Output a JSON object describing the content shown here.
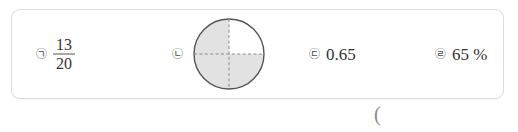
{
  "page": {
    "answer_paren": "("
  },
  "choice_box": {
    "options": [
      {
        "marker": "㉠",
        "type": "fraction",
        "numerator": "13",
        "denominator": "20",
        "text": "13/20"
      },
      {
        "marker": "㉡",
        "type": "pie-diagram",
        "text": "",
        "diagram": {
          "name": "circle-quarters",
          "total_parts": 4,
          "shaded_parts": 3,
          "shaded_quadrants": [
            "top-left",
            "bottom-left",
            "bottom-right"
          ],
          "unshaded_quadrants": [
            "top-right"
          ],
          "shade_color": "#e2e2e2",
          "outline_color": "#555555",
          "divider_style": "dashed",
          "divider_color": "#8a8a8a"
        }
      },
      {
        "marker": "㉢",
        "type": "decimal",
        "text": "0.65"
      },
      {
        "marker": "㉣",
        "type": "percent",
        "text": "65 %"
      }
    ]
  },
  "colors": {
    "box_border": "#dcdcdc",
    "text": "#333333",
    "marker": "#4a4a4a",
    "shade": "#e2e2e2"
  }
}
